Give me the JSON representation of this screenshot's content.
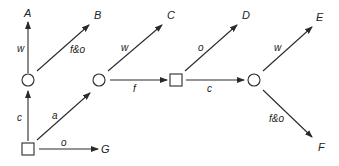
{
  "diagram": {
    "nodes": [
      {
        "id": "n1",
        "shape": "circle",
        "x": 28,
        "y": 80
      },
      {
        "id": "n2",
        "shape": "circle",
        "x": 99,
        "y": 80
      },
      {
        "id": "n3",
        "shape": "square",
        "x": 176,
        "y": 80
      },
      {
        "id": "n4",
        "shape": "circle",
        "x": 254,
        "y": 80
      },
      {
        "id": "n0",
        "shape": "square",
        "x": 28,
        "y": 149
      }
    ],
    "terminals": {
      "A": "A",
      "B": "B",
      "C": "C",
      "D": "D",
      "E": "E",
      "F": "F",
      "G": "G"
    },
    "edges": {
      "n1_A": "w",
      "n1_B": "f&o",
      "n2_C": "w",
      "n2_n3": "f",
      "n3_D": "o",
      "n3_n4": "c",
      "n4_E": "w",
      "n4_F": "f&o",
      "n0_n1": "c",
      "n0_n2": "a",
      "n0_G": "o"
    }
  }
}
